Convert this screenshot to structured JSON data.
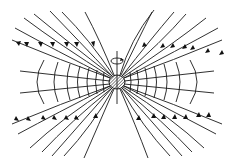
{
  "figure": {
    "width": 233,
    "height": 164,
    "colors": {
      "stroke": "#1a1a1a",
      "background": "#ffffff",
      "hatch": "#333333"
    },
    "center": {
      "x": 117,
      "y": 82
    },
    "body": {
      "shape": "hatched-ellipse",
      "rx": 8,
      "ry": 7
    },
    "rotation_axis": {
      "y_top": 51,
      "y_bottom": 104
    },
    "rotation_symbol": {
      "shape": "ellipse-with-arrow",
      "cy": 61,
      "rx": 6,
      "ry": 3
    },
    "current_sheet": {
      "left": {
        "x1": 20,
        "y1": 71,
        "x2": 117,
        "y2": 81
      },
      "left_lower": {
        "x1": 20,
        "y1": 93,
        "x2": 117,
        "y2": 83
      },
      "right": {
        "x1": 214,
        "y1": 71,
        "x2": 117,
        "y2": 81
      },
      "right_lower": {
        "x1": 214,
        "y1": 93,
        "x2": 117,
        "y2": 83
      }
    },
    "closed_loops_per_side": 7,
    "open_field_lines_per_quadrant": 7,
    "arrow_direction": {
      "upper": "outward-up",
      "lower": "inward-up"
    }
  }
}
